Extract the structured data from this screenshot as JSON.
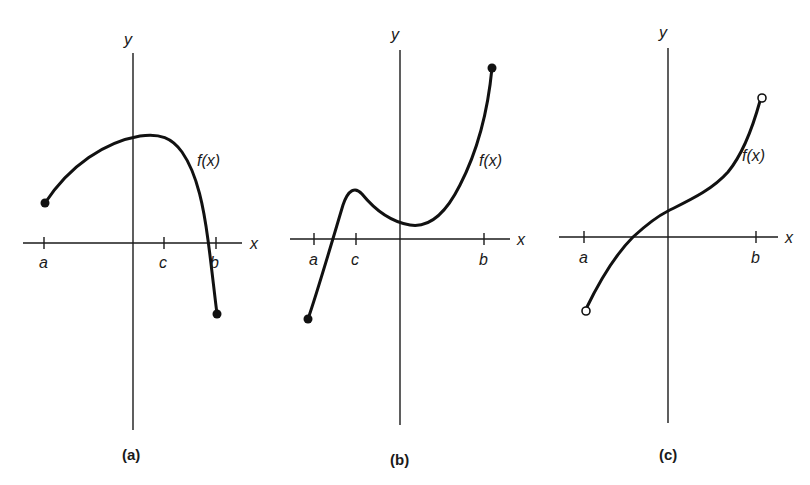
{
  "panels": [
    {
      "id": "a",
      "caption": "(a)",
      "y_label": "y",
      "x_label": "x",
      "function_label": "f(x)",
      "ticks": [
        {
          "label": "a"
        },
        {
          "label": "c"
        },
        {
          "label": "b"
        }
      ],
      "endpoints": {
        "left": "closed",
        "right": "closed"
      },
      "description": "Continuous on closed interval [a,b]; rises from f(a)>0 to maximum near x slightly right of y-axis, then drops steeply below x-axis to f(b)<0."
    },
    {
      "id": "b",
      "caption": "(b)",
      "y_label": "y",
      "x_label": "x",
      "function_label": "f(x)",
      "ticks": [
        {
          "label": "a"
        },
        {
          "label": "c"
        },
        {
          "label": "b"
        }
      ],
      "endpoints": {
        "left": "closed",
        "right": "closed"
      },
      "description": "Continuous on closed interval [a,b]; starts below x-axis, rises to local max at c, dips to local min just right of y-axis, then rises to absolute max at b."
    },
    {
      "id": "c",
      "caption": "(c)",
      "y_label": "y",
      "x_label": "x",
      "function_label": "f(x)",
      "ticks": [
        {
          "label": "a"
        },
        {
          "label": "b"
        }
      ],
      "endpoints": {
        "left": "open",
        "right": "open"
      },
      "description": "Increasing curve on open interval (a,b) with open circles at both endpoints; crosses x-axis left of origin."
    }
  ],
  "colors": {
    "ink": "#111111",
    "background": "#ffffff"
  }
}
